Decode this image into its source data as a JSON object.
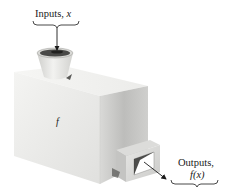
{
  "diagram": {
    "input": {
      "label_text": "Inputs, ",
      "variable": "x"
    },
    "machine": {
      "label": "f"
    },
    "output": {
      "label_line1": "Outputs,",
      "label_line2": "f(x)"
    },
    "colors": {
      "background": "#ffffff",
      "box_front": "#ececea",
      "box_top": "#f3f3f1",
      "box_side": "#c9c9c7",
      "pot": "#e2e2df",
      "soil": "#4a4a48",
      "ink": "#1a1a1a"
    }
  }
}
